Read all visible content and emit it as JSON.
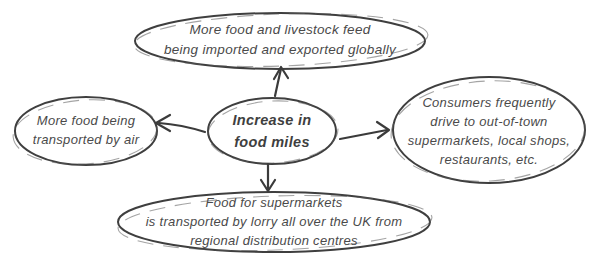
{
  "diagram": {
    "type": "concept-map",
    "background_color": "#ffffff",
    "stroke_color": "#3f3f3f",
    "text_color": "#4a4a4a",
    "center_node": {
      "id": "increase-in-food-miles",
      "lines": [
        "Increase in",
        "food miles"
      ]
    },
    "nodes": {
      "top": {
        "id": "imported-exported-globally",
        "lines": [
          "More food and livestock feed",
          "being imported and exported globally"
        ]
      },
      "left": {
        "id": "transported-by-air",
        "lines": [
          "More food being",
          "transported by air"
        ]
      },
      "right": {
        "id": "consumers-drive-to-shops",
        "lines": [
          "Consumers frequently",
          "drive to out-of-town",
          "supermarkets, local shops,",
          "restaurants, etc."
        ]
      },
      "bottom": {
        "id": "lorry-distribution",
        "lines": [
          "Food for supermarkets",
          "is transported by lorry all over the UK from",
          "regional distribution centres"
        ]
      }
    },
    "edges": [
      {
        "from": "increase-in-food-miles",
        "to": "imported-exported-globally",
        "direction": "up"
      },
      {
        "from": "increase-in-food-miles",
        "to": "transported-by-air",
        "direction": "left"
      },
      {
        "from": "increase-in-food-miles",
        "to": "consumers-drive-to-shops",
        "direction": "right"
      },
      {
        "from": "increase-in-food-miles",
        "to": "lorry-distribution",
        "direction": "down"
      }
    ]
  }
}
